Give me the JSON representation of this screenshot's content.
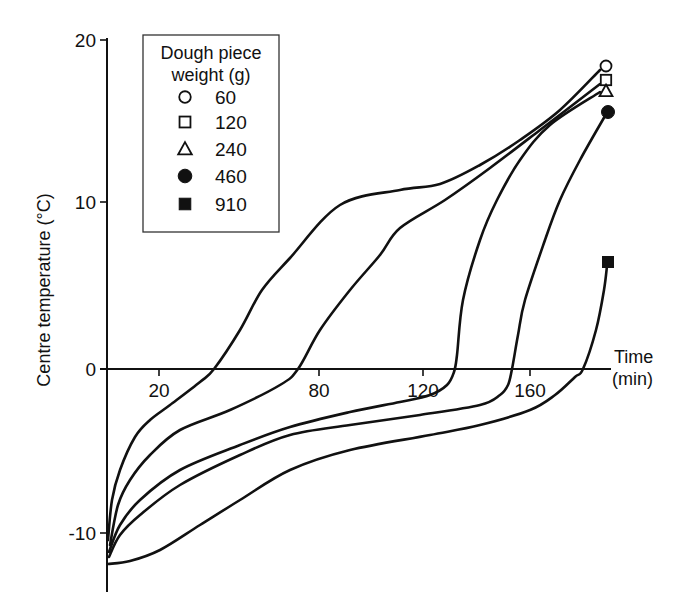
{
  "chart_data": {
    "type": "line",
    "title": "",
    "xlabel": "Time (min)",
    "xlabel_lines": [
      "Time",
      "(min)"
    ],
    "ylabel": "Centre temperature (°C)",
    "ylim": [
      -12,
      20
    ],
    "grid": false,
    "legend_position": "upper-left inset",
    "x_ticks": [
      {
        "label": "20",
        "px": 159
      },
      {
        "label": "80",
        "px": 319
      },
      {
        "label": "120",
        "px": 423
      },
      {
        "label": "160",
        "px": 530
      }
    ],
    "y_ticks": [
      {
        "label": "20",
        "value": 20,
        "py": 40
      },
      {
        "label": "10",
        "value": 10,
        "py": 202
      },
      {
        "label": "0",
        "value": 0,
        "py": 369
      },
      {
        "label": "-10",
        "value": -10,
        "py": 533
      }
    ],
    "legend": {
      "title_lines": [
        "Dough piece",
        "weight (g)"
      ],
      "entries": [
        {
          "label": "60",
          "marker": "open-circle"
        },
        {
          "label": "120",
          "marker": "open-square"
        },
        {
          "label": "240",
          "marker": "open-triangle"
        },
        {
          "label": "460",
          "marker": "filled-circle"
        },
        {
          "label": "910",
          "marker": "filled-square"
        }
      ]
    },
    "series": [
      {
        "name": "60",
        "marker": "open-circle",
        "end_value_c": 18.3,
        "zero_crossing_px": 214,
        "points_px": [
          [
            108,
            540
          ],
          [
            112,
            500
          ],
          [
            120,
            470
          ],
          [
            135,
            437
          ],
          [
            150,
            420
          ],
          [
            170,
            405
          ],
          [
            200,
            382
          ],
          [
            214,
            369
          ],
          [
            240,
            330
          ],
          [
            262,
            290
          ],
          [
            290,
            258
          ],
          [
            340,
            205
          ],
          [
            400,
            190
          ],
          [
            440,
            184
          ],
          [
            480,
            165
          ],
          [
            520,
            140
          ],
          [
            560,
            110
          ],
          [
            600,
            70
          ]
        ],
        "end_marker_px": [
          606,
          66
        ]
      },
      {
        "name": "120",
        "marker": "open-square",
        "end_value_c": 17.5,
        "zero_crossing_px": 298,
        "points_px": [
          [
            110,
            545
          ],
          [
            118,
            505
          ],
          [
            130,
            480
          ],
          [
            150,
            455
          ],
          [
            180,
            430
          ],
          [
            230,
            410
          ],
          [
            280,
            385
          ],
          [
            298,
            369
          ],
          [
            320,
            330
          ],
          [
            350,
            290
          ],
          [
            380,
            255
          ],
          [
            400,
            228
          ],
          [
            445,
            200
          ],
          [
            490,
            168
          ],
          [
            540,
            130
          ],
          [
            600,
            84
          ]
        ],
        "end_marker_px": [
          606,
          80
        ]
      },
      {
        "name": "240",
        "marker": "open-triangle",
        "end_value_c": 16.8,
        "zero_crossing_px": 457,
        "points_px": [
          [
            109,
            552
          ],
          [
            120,
            525
          ],
          [
            140,
            500
          ],
          [
            180,
            470
          ],
          [
            240,
            445
          ],
          [
            290,
            427
          ],
          [
            350,
            412
          ],
          [
            400,
            402
          ],
          [
            430,
            395
          ],
          [
            447,
            385
          ],
          [
            454,
            372
          ],
          [
            457,
            355
          ],
          [
            463,
            300
          ],
          [
            480,
            240
          ],
          [
            497,
            200
          ],
          [
            520,
            160
          ],
          [
            550,
            125
          ],
          [
            600,
            92
          ]
        ],
        "end_marker_px": [
          606,
          91
        ]
      },
      {
        "name": "460",
        "marker": "filled-circle",
        "end_value_c": 15.5,
        "zero_crossing_px": 513,
        "points_px": [
          [
            109,
            557
          ],
          [
            120,
            535
          ],
          [
            140,
            515
          ],
          [
            180,
            485
          ],
          [
            240,
            455
          ],
          [
            290,
            435
          ],
          [
            350,
            425
          ],
          [
            420,
            415
          ],
          [
            480,
            405
          ],
          [
            500,
            395
          ],
          [
            508,
            385
          ],
          [
            512,
            369
          ],
          [
            518,
            335
          ],
          [
            525,
            300
          ],
          [
            545,
            240
          ],
          [
            560,
            200
          ],
          [
            580,
            160
          ],
          [
            605,
            116
          ]
        ],
        "end_marker_px": [
          608,
          112
        ]
      },
      {
        "name": "910",
        "marker": "filled-square",
        "end_value_c": 6.5,
        "zero_crossing_px": 583,
        "points_px": [
          [
            108,
            564
          ],
          [
            130,
            561
          ],
          [
            160,
            550
          ],
          [
            200,
            525
          ],
          [
            240,
            500
          ],
          [
            290,
            470
          ],
          [
            350,
            450
          ],
          [
            430,
            435
          ],
          [
            480,
            425
          ],
          [
            530,
            410
          ],
          [
            555,
            395
          ],
          [
            575,
            377
          ],
          [
            583,
            369
          ],
          [
            596,
            330
          ],
          [
            604,
            290
          ],
          [
            607,
            266
          ]
        ],
        "end_marker_px": [
          608,
          262
        ]
      }
    ]
  }
}
